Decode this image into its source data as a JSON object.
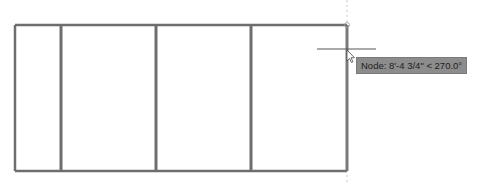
{
  "viewport": {
    "background": "#ffffff",
    "line_color": "#6e6e6e"
  },
  "drawing": {
    "frame": {
      "left": 15,
      "top": 25,
      "right": 347,
      "bottom": 171
    },
    "mullions_x": [
      61,
      156,
      251
    ]
  },
  "cursor": {
    "x": 347,
    "y": 49,
    "crosshair_half_width": 30
  },
  "tooltip": {
    "text": "Node: 8'-4 3/4\" < 270.0°",
    "snap_type": "Node",
    "distance": "8'-4 3/4\"",
    "angle": "270.0°"
  }
}
